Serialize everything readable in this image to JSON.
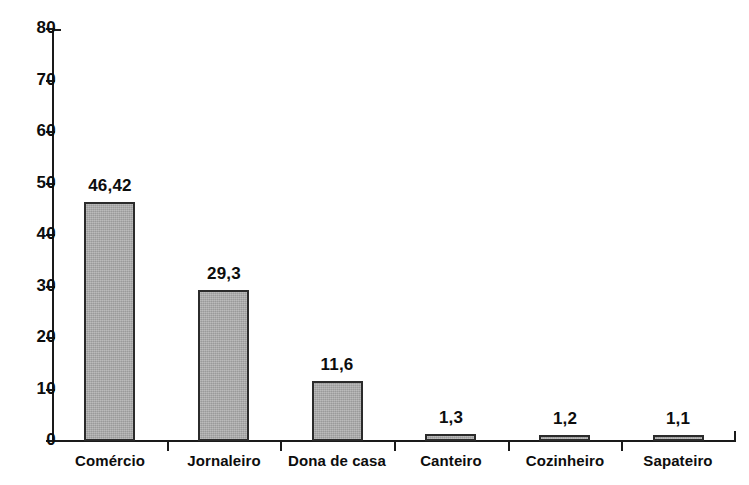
{
  "chart_data": {
    "type": "bar",
    "title": "",
    "subtitle": "",
    "xlabel": "",
    "ylabel": "",
    "categories": [
      "Comércio",
      "Jornaleiro",
      "Dona de casa",
      "Canteiro",
      "Cozinheiro",
      "Sapateiro"
    ],
    "values": [
      46.42,
      29.3,
      11.6,
      1.3,
      1.2,
      1.1
    ],
    "value_labels": [
      "46,42",
      "29,3",
      "11,6",
      "1,3",
      "1,2",
      "1,1"
    ],
    "ylim": [
      0,
      80
    ],
    "yticks": [
      0,
      10,
      20,
      30,
      40,
      50,
      60,
      70,
      80
    ],
    "ytick_labels": [
      "0",
      "10",
      "20",
      "30",
      "40",
      "50",
      "60",
      "70",
      "80"
    ],
    "grid": false,
    "legend": null,
    "series": [
      {
        "name": "",
        "values": [
          46.42,
          29.3,
          11.6,
          1.3,
          1.2,
          1.1
        ]
      }
    ],
    "colors": {
      "bar_fill": "#a9a9a9",
      "bar_border": "#2b2b2b",
      "axis": "#1a1a1a",
      "text": "#0d0d0d",
      "background": "#ffffff"
    }
  }
}
